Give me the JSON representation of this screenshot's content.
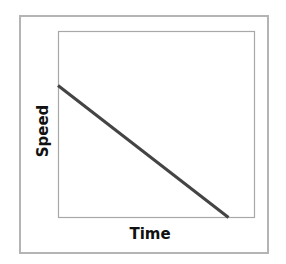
{
  "chart_data": {
    "type": "line",
    "title": "",
    "xlabel": "Time",
    "ylabel": "Speed",
    "x": [
      0,
      0.87
    ],
    "series": [
      {
        "name": "speed",
        "values": [
          0.71,
          0
        ]
      }
    ],
    "xlim": [
      0,
      1
    ],
    "ylim": [
      0,
      1
    ],
    "grid": false,
    "legend": null,
    "colors": {
      "line": "#444444",
      "axes": "#a0a0a0",
      "frame": "#b4b4b4"
    }
  },
  "axes": {
    "xlabel": "Time",
    "ylabel": "Speed"
  }
}
